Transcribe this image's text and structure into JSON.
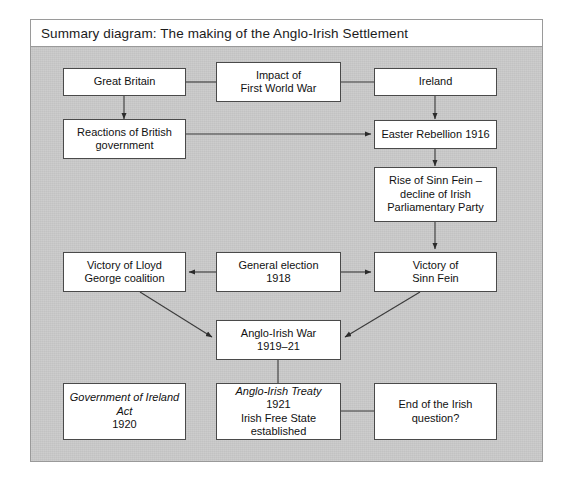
{
  "panel": {
    "title": "Summary diagram: The making of the Anglo-Irish Settlement",
    "frame_color": "#9a9a9a",
    "body_color": "#c9c9c9",
    "title_bar_color": "#ffffff",
    "node_fill": "#ffffff",
    "node_border": "#4a4a4a",
    "link_color": "#333333"
  },
  "nodes": {
    "great_britain": {
      "label": "Great Britain"
    },
    "impact_wwi": {
      "line1": "Impact of",
      "line2": "First World War"
    },
    "ireland": {
      "label": "Ireland"
    },
    "reactions_british_gov": {
      "line1": "Reactions of British",
      "line2": "government"
    },
    "easter_rebellion": {
      "label": "Easter Rebellion 1916"
    },
    "rise_sinn_fein": {
      "line1": "Rise of Sinn Fein –",
      "line2": "decline of Irish",
      "line3": "Parliamentary Party"
    },
    "victory_lloyd_george": {
      "line1": "Victory of Lloyd",
      "line2": "George coalition"
    },
    "general_election": {
      "line1": "General election",
      "line2": "1918"
    },
    "victory_sinn_fein": {
      "line1": "Victory of",
      "line2": "Sinn Fein"
    },
    "anglo_irish_war": {
      "line1": "Anglo-Irish War",
      "line2": "1919–21"
    },
    "government_ireland_act": {
      "italic1": "Government of Ireland",
      "italic2": "Act",
      "roman2": " 1920"
    },
    "anglo_irish_treaty": {
      "italic1": "Anglo-Irish Treaty",
      "roman1": " 1921",
      "line2": "Irish Free State",
      "line3": "established"
    },
    "end_irish_question": {
      "line1": "End of the Irish",
      "line2": "question?"
    }
  },
  "connections": [
    {
      "from": "great-britain",
      "to": "impact-wwi",
      "style": "plain-line"
    },
    {
      "from": "impact-wwi",
      "to": "ireland",
      "style": "plain-line"
    },
    {
      "from": "great-britain",
      "to": "reactions-british-gov",
      "style": "arrow-down"
    },
    {
      "from": "ireland",
      "to": "easter-rebellion",
      "style": "arrow-down"
    },
    {
      "from": "reactions-british-gov",
      "to": "easter-rebellion",
      "style": "arrow-right"
    },
    {
      "from": "easter-rebellion",
      "to": "rise-sinn-fein",
      "style": "arrow-down"
    },
    {
      "from": "rise-sinn-fein",
      "to": "victory-sinn-fein",
      "style": "arrow-down"
    },
    {
      "from": "general-election",
      "to": "victory-lloyd-george",
      "style": "arrow-left"
    },
    {
      "from": "general-election",
      "to": "victory-sinn-fein",
      "style": "arrow-right"
    },
    {
      "from": "victory-lloyd-george",
      "to": "anglo-irish-war",
      "style": "arrow-diagonal"
    },
    {
      "from": "victory-sinn-fein",
      "to": "anglo-irish-war",
      "style": "arrow-diagonal"
    },
    {
      "from": "anglo-irish-war",
      "to": "anglo-irish-treaty",
      "style": "plain-line"
    },
    {
      "from": "anglo-irish-treaty",
      "to": "end-irish-question",
      "style": "plain-line"
    }
  ]
}
